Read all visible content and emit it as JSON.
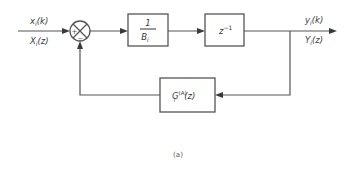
{
  "diagram": {
    "type": "block-diagram",
    "input": {
      "time_label": "x",
      "time_sub": "i",
      "time_arg": "(k)",
      "z_label": "X",
      "z_sub": "i",
      "z_arg": "(z)"
    },
    "summing_junction": {
      "plus_sign": "+",
      "minus_sign": "−"
    },
    "blocks": [
      {
        "id": "gain",
        "numerator": "1",
        "denominator": "B",
        "denominator_sub": "i"
      },
      {
        "id": "delay",
        "label": "z",
        "superscript": "−1"
      },
      {
        "id": "feedback",
        "label": "G",
        "sub": "i",
        "superscript": "(A)",
        "arg": "(z)"
      }
    ],
    "output": {
      "time_label": "y",
      "time_sub": "i",
      "time_arg": "(k)",
      "z_label": "Y",
      "z_sub": "i",
      "z_arg": "(z)"
    },
    "caption": "(a)",
    "colors": {
      "line": "#555555",
      "text": "#3a3a3a",
      "background": "#ffffff"
    }
  }
}
